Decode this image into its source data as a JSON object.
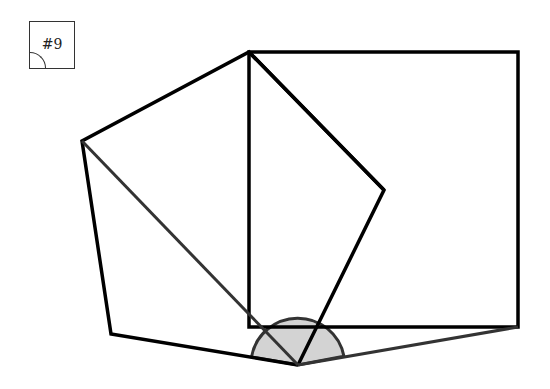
{
  "figure": {
    "label": "#9",
    "colors": {
      "stroke": "#000000",
      "gray_stroke": "#333333",
      "angle_fill": "#d3d3d3"
    },
    "points": {
      "pentagon_left": [
        82,
        141
      ],
      "top_shared": [
        249,
        52
      ],
      "pentagon_right": [
        384,
        190
      ],
      "bottom_vertex": [
        298,
        365
      ],
      "bottom_left": [
        111,
        334
      ],
      "square_top_right": [
        518,
        52
      ],
      "square_bottom_right": [
        518,
        327
      ],
      "square_bottom_left": [
        249,
        327
      ]
    },
    "angle_marker": {
      "center": [
        298,
        365
      ],
      "radius": 47
    }
  }
}
